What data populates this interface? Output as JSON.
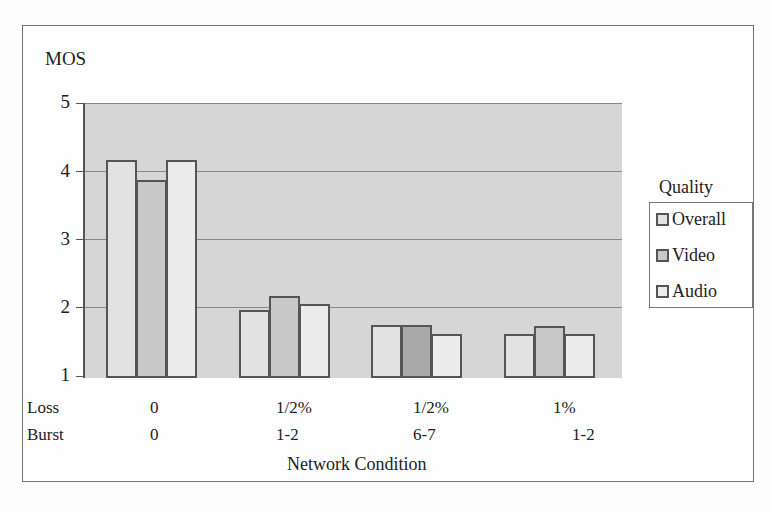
{
  "chart_data": {
    "type": "bar",
    "title": "",
    "ylabel": "MOS",
    "xlabel": "Network Condition",
    "ylim": [
      1,
      5
    ],
    "yticks": [
      1,
      2,
      3,
      4,
      5
    ],
    "grid": true,
    "legend_position": "right",
    "legend_title": "Quality",
    "row_labels": [
      "Loss",
      "Burst"
    ],
    "categories": [
      {
        "loss": "0",
        "burst": "0"
      },
      {
        "loss": "1/2%",
        "burst": "1-2"
      },
      {
        "loss": "1/2%",
        "burst": "6-7"
      },
      {
        "loss": "1%",
        "burst": "1-2"
      }
    ],
    "series": [
      {
        "name": "Overall",
        "color": "#e2e2e2",
        "values": [
          4.2,
          2.0,
          1.78,
          1.65
        ]
      },
      {
        "name": "Video",
        "color": "#c8c8c8",
        "values": [
          3.9,
          2.2,
          1.78,
          1.76
        ]
      },
      {
        "name": "Audio",
        "color": "#ececec",
        "values": [
          4.2,
          2.08,
          1.65,
          1.65
        ]
      }
    ]
  },
  "labels": {
    "y_axis": "MOS",
    "x_axis": "Network Condition",
    "loss_row": "Loss",
    "burst_row": "Burst",
    "legend_title": "Quality",
    "legend": [
      "Overall",
      "Video",
      "Audio"
    ],
    "yticks": [
      "5",
      "4",
      "3",
      "2",
      "1"
    ],
    "loss": [
      "0",
      "1/2%",
      "1/2%",
      "1%"
    ],
    "burst": [
      "0",
      "1-2",
      "6-7",
      "1-2"
    ]
  }
}
